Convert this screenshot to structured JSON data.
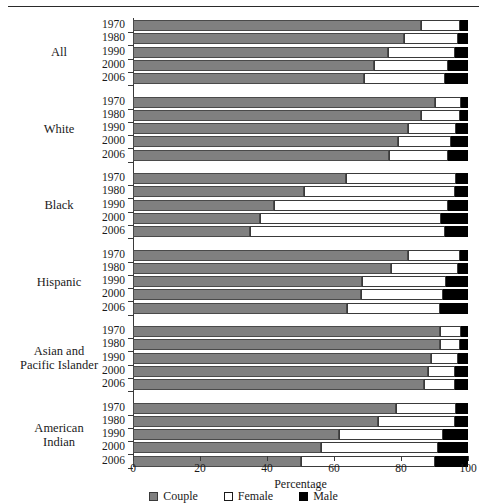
{
  "chart_data": {
    "type": "bar",
    "orientation": "horizontal",
    "stacked": true,
    "title": "",
    "xlabel": "Percentage",
    "ylabel": "",
    "xlim": [
      0,
      100
    ],
    "xticks": [
      0,
      20,
      40,
      60,
      80,
      100
    ],
    "grid": false,
    "legend_position": "bottom",
    "series": [
      {
        "name": "Couple",
        "color": "#808080"
      },
      {
        "name": "Female",
        "color": "#ffffff"
      },
      {
        "name": "Male",
        "color": "#000000"
      }
    ],
    "groups": [
      {
        "label": "All",
        "rows": [
          {
            "year": "1970",
            "Couple": 86.0,
            "Female": 11.5,
            "Male": 2.5
          },
          {
            "year": "1980",
            "Couple": 81.0,
            "Female": 16.0,
            "Male": 3.0
          },
          {
            "year": "1990",
            "Couple": 76.0,
            "Female": 20.0,
            "Male": 4.0
          },
          {
            "year": "2000",
            "Couple": 72.0,
            "Female": 22.0,
            "Male": 6.0
          },
          {
            "year": "2006",
            "Couple": 69.0,
            "Female": 24.0,
            "Male": 7.0
          }
        ]
      },
      {
        "label": "White",
        "rows": [
          {
            "year": "1970",
            "Couple": 90.0,
            "Female": 8.0,
            "Male": 2.0
          },
          {
            "year": "1980",
            "Couple": 86.0,
            "Female": 11.5,
            "Male": 2.5
          },
          {
            "year": "1990",
            "Couple": 82.0,
            "Female": 14.5,
            "Male": 3.5
          },
          {
            "year": "2000",
            "Couple": 79.0,
            "Female": 16.0,
            "Male": 5.0
          },
          {
            "year": "2006",
            "Couple": 76.5,
            "Female": 17.5,
            "Male": 6.0
          }
        ]
      },
      {
        "label": "Black",
        "rows": [
          {
            "year": "1970",
            "Couple": 63.5,
            "Female": 33.0,
            "Male": 3.5
          },
          {
            "year": "1980",
            "Couple": 51.0,
            "Female": 45.0,
            "Male": 4.0
          },
          {
            "year": "1990",
            "Couple": 42.0,
            "Female": 52.0,
            "Male": 6.0
          },
          {
            "year": "2000",
            "Couple": 38.0,
            "Female": 54.0,
            "Male": 8.0
          },
          {
            "year": "2006",
            "Couple": 35.0,
            "Female": 58.0,
            "Male": 7.0
          }
        ]
      },
      {
        "label": "Hispanic",
        "rows": [
          {
            "year": "1970",
            "Couple": 82.0,
            "Female": 15.5,
            "Male": 2.5
          },
          {
            "year": "1980",
            "Couple": 77.0,
            "Female": 20.0,
            "Male": 3.0
          },
          {
            "year": "1990",
            "Couple": 68.5,
            "Female": 25.0,
            "Male": 6.5
          },
          {
            "year": "2000",
            "Couple": 68.0,
            "Female": 24.5,
            "Male": 7.5
          },
          {
            "year": "2006",
            "Couple": 64.0,
            "Female": 27.5,
            "Male": 8.5
          }
        ]
      },
      {
        "label": "Asian and Pacific Islander",
        "rows": [
          {
            "year": "1970",
            "Couple": 91.5,
            "Female": 6.5,
            "Male": 2.0
          },
          {
            "year": "1980",
            "Couple": 91.5,
            "Female": 6.0,
            "Male": 2.5
          },
          {
            "year": "1990",
            "Couple": 89.0,
            "Female": 8.0,
            "Male": 3.0
          },
          {
            "year": "2000",
            "Couple": 88.0,
            "Female": 8.0,
            "Male": 4.0
          },
          {
            "year": "2006",
            "Couple": 87.0,
            "Female": 9.0,
            "Male": 4.0
          }
        ]
      },
      {
        "label": "American Indian",
        "rows": [
          {
            "year": "1970",
            "Couple": 78.5,
            "Female": 18.0,
            "Male": 3.5
          },
          {
            "year": "1980",
            "Couple": 73.0,
            "Female": 23.0,
            "Male": 4.0
          },
          {
            "year": "1990",
            "Couple": 61.5,
            "Female": 31.0,
            "Male": 7.5
          },
          {
            "year": "2000",
            "Couple": 56.0,
            "Female": 35.0,
            "Male": 9.0
          },
          {
            "year": "2006",
            "Couple": 50.0,
            "Female": 40.0,
            "Male": 10.0
          }
        ]
      }
    ]
  },
  "legend": {
    "items": [
      {
        "label": "Couple"
      },
      {
        "label": "Female"
      },
      {
        "label": "Male"
      }
    ]
  }
}
